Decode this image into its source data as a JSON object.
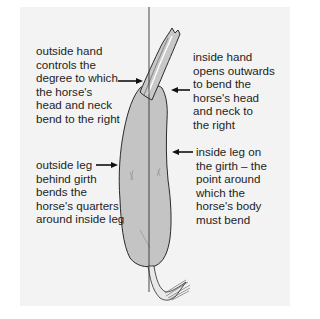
{
  "figure": {
    "colors": {
      "background": "#f3f3f3",
      "horse_fill": "#c4c4c4",
      "horse_stroke": "#2a2a2a",
      "text": "#1e1e1e"
    },
    "centre_line": {
      "x": 149,
      "y_top": 7,
      "y_bottom": 292
    },
    "labels": {
      "outside_hand": "outside hand\ncontrols the\ndegree to which\nthe horse's\nhead and neck\nbend to the right",
      "inside_hand": "inside hand\nopens outwards\nto bend the\nhorse's head\nand neck to\nthe right",
      "outside_leg": "outside leg\nbehind girth\nbends the\nhorse's quarters\naround inside leg",
      "inside_leg": "inside leg on\nthe girth – the\npoint around\nwhich the\nhorse's body\nmust bend"
    },
    "arrows": [
      {
        "name": "outside-hand-arrow",
        "direction": "right"
      },
      {
        "name": "inside-hand-arrow",
        "direction": "left"
      },
      {
        "name": "outside-leg-arrow",
        "direction": "right"
      },
      {
        "name": "inside-leg-arrow",
        "direction": "left"
      }
    ]
  }
}
